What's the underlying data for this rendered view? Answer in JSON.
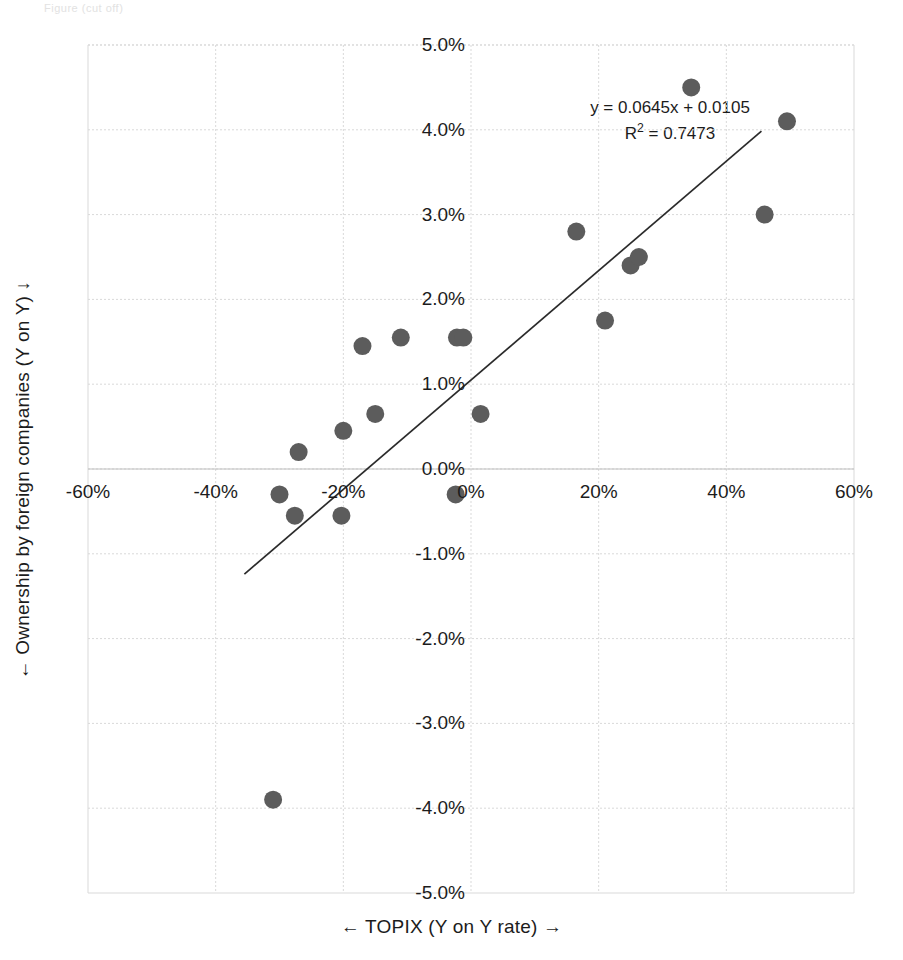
{
  "ghost_text": "Figure (cut off)",
  "axes": {
    "x_title": "←  TOPIX (Y on Y rate) →",
    "y_title": "←  Ownership by foreign companies (Y on Y)  ↓",
    "x_ticks": [
      "-60%",
      "-40%",
      "-20%",
      "0%",
      "20%",
      "40%",
      "60%"
    ],
    "y_ticks": [
      "5.0%",
      "4.0%",
      "3.0%",
      "2.0%",
      "1.0%",
      "0.0%",
      "-1.0%",
      "-2.0%",
      "-3.0%",
      "-4.0%",
      "-5.0%"
    ]
  },
  "annotation": {
    "equation": "y = 0.0645x + 0.0105",
    "r2_prefix": "R",
    "r2_sup": "2",
    "r2_value": " = 0.7473"
  },
  "colors": {
    "marker": "#5c5c5c",
    "trendline": "#2b2b2b",
    "grid": "#d9d9d9",
    "text": "#1c1c1c",
    "background": "#ffffff"
  },
  "chart_data": {
    "type": "scatter",
    "title": "",
    "xlabel": "←  TOPIX (Y on Y rate) →",
    "ylabel": "←  Ownership by foreign companies (Y on Y)  ↓",
    "xlim": [
      -60,
      60
    ],
    "ylim": [
      -5.0,
      5.0
    ],
    "x_tick_values": [
      -60,
      -40,
      -20,
      0,
      20,
      40,
      60
    ],
    "y_tick_values": [
      5.0,
      4.0,
      3.0,
      2.0,
      1.0,
      0.0,
      -1.0,
      -2.0,
      -3.0,
      -4.0,
      -5.0
    ],
    "x_unit": "%",
    "y_unit": "%",
    "grid": true,
    "legend": "none",
    "marker_radius_px": 9,
    "points": [
      {
        "x": -31.0,
        "y": -3.9
      },
      {
        "x": -30.0,
        "y": -0.3
      },
      {
        "x": -27.6,
        "y": -0.55
      },
      {
        "x": -27.0,
        "y": 0.2
      },
      {
        "x": -20.3,
        "y": -0.55
      },
      {
        "x": -20.0,
        "y": 0.45
      },
      {
        "x": -17.0,
        "y": 1.45
      },
      {
        "x": -15.0,
        "y": 0.65
      },
      {
        "x": -11.0,
        "y": 1.55
      },
      {
        "x": -2.4,
        "y": -0.3
      },
      {
        "x": -2.2,
        "y": 1.55
      },
      {
        "x": -1.2,
        "y": 1.55
      },
      {
        "x": 1.5,
        "y": 0.65
      },
      {
        "x": 16.5,
        "y": 2.8
      },
      {
        "x": 21.0,
        "y": 1.75
      },
      {
        "x": 25.0,
        "y": 2.4
      },
      {
        "x": 26.3,
        "y": 2.5
      },
      {
        "x": 34.5,
        "y": 4.5
      },
      {
        "x": 46.0,
        "y": 3.0
      },
      {
        "x": 49.5,
        "y": 4.1
      }
    ],
    "trendline": {
      "slope": 0.0645,
      "intercept": 0.0105,
      "r_squared": 0.7473,
      "label": "y = 0.0645x + 0.0105",
      "r2_label": "R² = 0.7473",
      "x_start": -35.5,
      "x_end": 45.5
    }
  }
}
